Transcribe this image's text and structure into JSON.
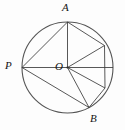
{
  "figure": {
    "type": "geometry-diagram",
    "canvas": {
      "width": 125,
      "height": 130
    },
    "colors": {
      "background": "#fdfdfd",
      "stroke": "#3a3a3a",
      "circle_stroke": "#555555",
      "label_text": "#141414"
    },
    "circle": {
      "name": "main-circle",
      "center_x": 67.5,
      "center_y": 67.5,
      "radius": 45.5,
      "stroke_width": 1.1
    },
    "points": [
      {
        "id": "A",
        "label": "A",
        "x": 67.5,
        "y": 22.0,
        "labeled": true
      },
      {
        "id": "P",
        "label": "P",
        "x": 22.0,
        "y": 67.5,
        "labeled": true
      },
      {
        "id": "O",
        "label": "O",
        "x": 67.5,
        "y": 67.5,
        "labeled": true
      },
      {
        "id": "B",
        "label": "B",
        "x": 89.0,
        "y": 107.5,
        "labeled": true
      },
      {
        "id": "Q",
        "label": "",
        "x": 104.5,
        "y": 45.5,
        "labeled": false
      },
      {
        "id": "R",
        "label": "",
        "x": 113.0,
        "y": 67.5,
        "labeled": false
      },
      {
        "id": "S",
        "label": "",
        "x": 105.0,
        "y": 88.0,
        "labeled": false
      }
    ],
    "segments": [
      {
        "name": "chord-A-P",
        "from": "A",
        "to": "P"
      },
      {
        "name": "chord-P-B",
        "from": "P",
        "to": "B"
      },
      {
        "name": "chord-A-Q",
        "from": "A",
        "to": "Q"
      },
      {
        "name": "chord-Q-S",
        "from": "Q",
        "to": "S"
      },
      {
        "name": "chord-S-B",
        "from": "S",
        "to": "B"
      },
      {
        "name": "radius-O-A",
        "from": "O",
        "to": "A"
      },
      {
        "name": "radius-O-P",
        "from": "O",
        "to": "P"
      },
      {
        "name": "radius-O-Q",
        "from": "O",
        "to": "Q"
      },
      {
        "name": "radius-O-R",
        "from": "O",
        "to": "R"
      },
      {
        "name": "radius-O-S",
        "from": "O",
        "to": "S"
      },
      {
        "name": "radius-O-B",
        "from": "O",
        "to": "B"
      }
    ],
    "labels": {
      "A": "A",
      "P": "P",
      "O": "O",
      "B": "B"
    }
  }
}
